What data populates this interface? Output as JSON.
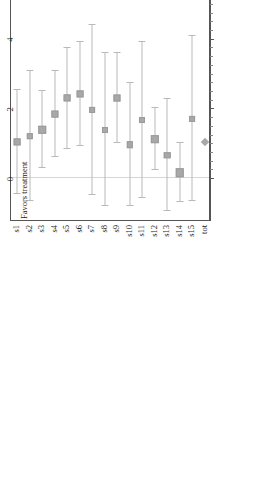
{
  "chart_data": {
    "type": "scatter",
    "subtype": "forest-plot",
    "title": "",
    "xlabel": "",
    "ylabel": "",
    "xlim": [
      -1.2,
      10.5
    ],
    "xticks": [
      0,
      2,
      4,
      6,
      8,
      10
    ],
    "xticklabels": [
      "0",
      "2",
      "4",
      "6",
      "8",
      "10"
    ],
    "grid": false,
    "reference_line": 0,
    "annotations": {
      "left": "Favors treatment",
      "right": "Favors placebo"
    },
    "columns": [
      "log_OR",
      "LCL",
      "UCL",
      "Weight"
    ],
    "categories": [
      "s1",
      "s2",
      "s3",
      "s4",
      "s5",
      "s6",
      "s7",
      "s8",
      "s9",
      "s10",
      "s11",
      "s12",
      "s13",
      "s14",
      "s15",
      "tot"
    ],
    "rows": [
      {
        "label": "s1",
        "log_OR": 1.034,
        "LCL": -0.466,
        "UCL": 2.535,
        "weight": "9%",
        "log_OR_text": "1.034",
        "LCL_text": "−.466",
        "UCL_text": "2.535",
        "marker": "square"
      },
      {
        "label": "s2",
        "log_OR": 1.204,
        "LCL": -0.664,
        "UCL": 3.072,
        "weight": "6%",
        "log_OR_text": "1.204",
        "LCL_text": "−.664",
        "UCL_text": "3.072",
        "marker": "square"
      },
      {
        "label": "s3",
        "log_OR": 1.389,
        "LCL": 0.287,
        "UCL": 2.492,
        "weight": "16%",
        "log_OR_text": "1.389",
        "LCL_text": "0.287",
        "UCL_text": "2.492",
        "marker": "square"
      },
      {
        "label": "s4",
        "log_OR": 1.838,
        "LCL": 0.595,
        "UCL": 3.082,
        "weight": "12%",
        "log_OR_text": "1.838",
        "LCL_text": "0.595",
        "UCL_text": "3.082",
        "marker": "square"
      },
      {
        "label": "s5",
        "log_OR": 2.294,
        "LCL": 0.845,
        "UCL": 3.744,
        "weight": "9%",
        "log_OR_text": "2.294",
        "LCL_text": "0.845",
        "UCL_text": "3.744",
        "marker": "square"
      },
      {
        "label": "s6",
        "log_OR": 2.42,
        "LCL": 0.923,
        "UCL": 3.917,
        "weight": "9%",
        "log_OR_text": "2.420",
        "LCL_text": "0.923",
        "UCL_text": "3.917",
        "marker": "square"
      },
      {
        "label": "s7",
        "log_OR": 1.946,
        "LCL": -0.489,
        "UCL": 4.38,
        "weight": "3%",
        "log_OR_text": "1.946",
        "LCL_text": "−.489",
        "UCL_text": "4.380",
        "marker": "square"
      },
      {
        "label": "s8",
        "log_OR": 1.386,
        "LCL": -0.805,
        "UCL": 3.578,
        "weight": "4%",
        "log_OR_text": "1.386",
        "LCL_text": "−.805",
        "UCL_text": "3.578",
        "marker": "square"
      },
      {
        "label": "s9",
        "log_OR": 2.305,
        "LCL": 1.007,
        "UCL": 3.603,
        "weight": "11%",
        "log_OR_text": "2.305",
        "LCL_text": "1.007",
        "UCL_text": "3.603",
        "marker": "square"
      },
      {
        "label": "s10",
        "log_OR": 0.965,
        "LCL": -0.798,
        "UCL": 2.729,
        "weight": "6%",
        "log_OR_text": "0.965",
        "LCL_text": "−.798",
        "UCL_text": "2.729",
        "marker": "square"
      },
      {
        "label": "s11",
        "log_OR": 1.664,
        "LCL": -0.578,
        "UCL": 3.905,
        "weight": "4%",
        "log_OR_text": "1.664",
        "LCL_text": "−.578",
        "UCL_text": "3.905",
        "marker": "square"
      },
      {
        "label": "s12",
        "log_OR": 1.123,
        "LCL": 0.24,
        "UCL": 2.007,
        "weight": "25%",
        "log_OR_text": "1.123",
        "LCL_text": "0.240",
        "UCL_text": "2.007",
        "marker": "square"
      },
      {
        "label": "s13",
        "log_OR": 0.657,
        "LCL": -0.948,
        "UCL": 2.262,
        "weight": "7%",
        "log_OR_text": "0.657",
        "LCL_text": "−.948",
        "UCL_text": "2.262",
        "marker": "square"
      },
      {
        "label": "s14",
        "log_OR": 0.158,
        "LCL": -0.681,
        "UCL": 0.996,
        "weight": "27%",
        "log_OR_text": "0.158",
        "LCL_text": "−.681",
        "UCL_text": "0.996",
        "marker": "square"
      },
      {
        "label": "s15",
        "log_OR": 1.705,
        "LCL": -0.668,
        "UCL": 4.078,
        "weight": "3%",
        "log_OR_text": "1.705",
        "LCL_text": "−.668",
        "UCL_text": "4.078",
        "marker": "square"
      },
      {
        "label": "tot",
        "log_OR": 1.034,
        "LCL": null,
        "UCL": null,
        "weight": "",
        "log_OR_text": "",
        "LCL_text": "",
        "UCL_text": "",
        "marker": "diamond"
      }
    ]
  },
  "table": {
    "headers": {
      "log_or": "log_OR",
      "lcl": "LCL",
      "ucl": "UCL",
      "weight": "Weight"
    }
  },
  "axis": {
    "favors_treatment": "Favors treatment",
    "favors_placebo": "Favors placebo"
  },
  "colors": {
    "marker": "#a8a8a8",
    "whisker": "#b9b9b9",
    "frame": "#555555",
    "reference_line": "#d6d6d6",
    "text": "#1a1a1a"
  }
}
